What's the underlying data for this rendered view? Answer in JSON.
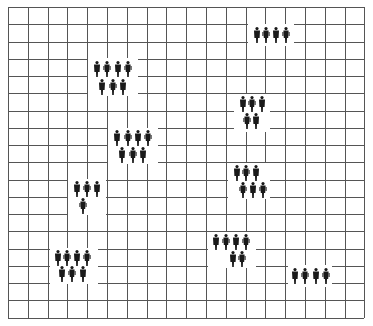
{
  "diagram": {
    "type": "grid-with-people-clusters",
    "colors": {
      "background": "#ffffff",
      "grid": "#555555",
      "figure": "#1a1a1a"
    },
    "grid": {
      "x0": 8,
      "y0": 7,
      "cols": 18,
      "rows": 18,
      "cell_w": 19.8,
      "cell_h": 17.25
    },
    "clusters": [
      {
        "id": "cluster-1",
        "patch": [
          248,
          24,
          46,
          22
        ],
        "rows": [
          {
            "y": 35,
            "xs": [
              257,
              266,
              276,
              286
            ]
          }
        ]
      },
      {
        "id": "cluster-2",
        "patch": [
          88,
          58,
          50,
          38
        ],
        "rows": [
          {
            "y": 69,
            "xs": [
              97,
              107,
              118,
              128
            ]
          },
          {
            "y": 87,
            "xs": [
              102,
              113,
              123
            ]
          }
        ]
      },
      {
        "id": "cluster-3",
        "patch": [
          234,
          94,
          36,
          38
        ],
        "rows": [
          {
            "y": 104,
            "xs": [
              243,
              252,
              262
            ]
          },
          {
            "y": 121,
            "xs": [
              247,
              256
            ]
          }
        ]
      },
      {
        "id": "cluster-4",
        "patch": [
          108,
          128,
          50,
          36
        ],
        "rows": [
          {
            "y": 138,
            "xs": [
              117,
              128,
              138,
              148
            ]
          },
          {
            "y": 155,
            "xs": [
              122,
              133,
              143
            ]
          }
        ]
      },
      {
        "id": "cluster-5",
        "patch": [
          68,
          179,
          38,
          36
        ],
        "rows": [
          {
            "y": 189,
            "xs": [
              77,
              87,
              97
            ]
          },
          {
            "y": 206,
            "xs": [
              83
            ]
          }
        ]
      },
      {
        "id": "cluster-6",
        "patch": [
          228,
          163,
          42,
          36
        ],
        "rows": [
          {
            "y": 173,
            "xs": [
              237,
              246,
              256
            ]
          },
          {
            "y": 190,
            "xs": [
              243,
              253,
              263
            ]
          }
        ]
      },
      {
        "id": "cluster-7",
        "patch": [
          50,
          248,
          48,
          36
        ],
        "rows": [
          {
            "y": 258,
            "xs": [
              58,
              67,
              77,
              87
            ]
          },
          {
            "y": 274,
            "xs": [
              62,
              72,
              83
            ]
          }
        ]
      },
      {
        "id": "cluster-8",
        "patch": [
          208,
          232,
          48,
          36
        ],
        "rows": [
          {
            "y": 242,
            "xs": [
              216,
              226,
              236,
              246
            ]
          },
          {
            "y": 259,
            "xs": [
              233,
              242
            ]
          }
        ]
      },
      {
        "id": "cluster-9",
        "patch": [
          288,
          265,
          44,
          22
        ],
        "rows": [
          {
            "y": 276,
            "xs": [
              295,
              305,
              316,
              326
            ]
          }
        ]
      }
    ]
  }
}
